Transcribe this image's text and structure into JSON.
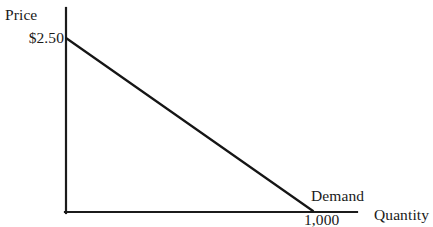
{
  "chart_data": {
    "type": "line",
    "title": "",
    "xlabel": "Quantity",
    "ylabel": "Price",
    "grid": false,
    "legend": "none",
    "xlim": [
      0,
      1000
    ],
    "ylim": [
      0,
      2.5
    ],
    "axis_labels": {
      "y_axis_title": "Price",
      "x_axis_title": "Quantity"
    },
    "tick_labels": {
      "y_ticks": [
        "$2.50"
      ],
      "x_ticks": [
        "1,000"
      ]
    },
    "annotations": [
      {
        "text": "Demand",
        "x": 1000,
        "y": 0
      }
    ],
    "series": [
      {
        "name": "Demand",
        "points": [
          {
            "x": 0,
            "y": 2.5
          },
          {
            "x": 1000,
            "y": 0
          }
        ]
      }
    ],
    "colors": {
      "axis": "#1b1b1b",
      "demand_line": "#151515",
      "background": "#ffffff",
      "text": "#1a1a1a"
    }
  },
  "labels": {
    "price_axis": "Price",
    "price_intercept": "$2.50",
    "demand_curve": "Demand",
    "quantity_intercept": "1,000",
    "quantity_axis": "Quantity"
  }
}
